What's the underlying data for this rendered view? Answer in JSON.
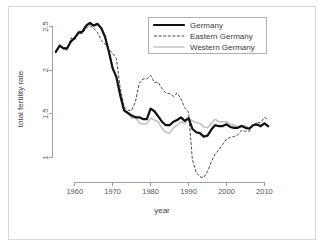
{
  "figure": {
    "background_color": "#ffffff",
    "border_color": "#d8d8d8"
  },
  "chart_data": {
    "type": "line",
    "title": "",
    "xlabel": "year",
    "ylabel": "total fertility rate",
    "xlim": [
      1954,
      2012
    ],
    "ylim": [
      0.72,
      2.62
    ],
    "xticks": [
      1960,
      1970,
      1980,
      1990,
      2000,
      2010
    ],
    "xticklabels": [
      "1960",
      "1970",
      "1980",
      "1990",
      "2000",
      "2010"
    ],
    "yticks": [
      1,
      1.5,
      2,
      2.5
    ],
    "yticklabels": [
      "1",
      "1.5",
      "2",
      "2.5"
    ],
    "grid": false,
    "legend_position": "top-right",
    "series": [
      {
        "name": "Germany",
        "color": "#111111",
        "style": "solid-thick",
        "x": [
          1955,
          1956,
          1957,
          1958,
          1959,
          1960,
          1961,
          1962,
          1963,
          1964,
          1965,
          1966,
          1967,
          1968,
          1969,
          1970,
          1971,
          1972,
          1973,
          1974,
          1975,
          1976,
          1977,
          1978,
          1979,
          1980,
          1981,
          1982,
          1983,
          1984,
          1985,
          1986,
          1987,
          1988,
          1989,
          1990,
          1991,
          1992,
          1993,
          1994,
          1995,
          1996,
          1997,
          1998,
          1999,
          2000,
          2001,
          2002,
          2003,
          2004,
          2005,
          2006,
          2007,
          2008,
          2009,
          2010,
          2011
        ],
        "values": [
          2.21,
          2.28,
          2.25,
          2.25,
          2.33,
          2.37,
          2.43,
          2.44,
          2.51,
          2.54,
          2.51,
          2.53,
          2.48,
          2.38,
          2.21,
          2.02,
          1.92,
          1.71,
          1.54,
          1.51,
          1.48,
          1.46,
          1.46,
          1.44,
          1.44,
          1.56,
          1.53,
          1.47,
          1.41,
          1.37,
          1.37,
          1.41,
          1.43,
          1.46,
          1.42,
          1.45,
          1.33,
          1.29,
          1.28,
          1.24,
          1.25,
          1.32,
          1.37,
          1.36,
          1.36,
          1.38,
          1.35,
          1.34,
          1.34,
          1.36,
          1.34,
          1.33,
          1.37,
          1.38,
          1.36,
          1.39,
          1.36
        ]
      },
      {
        "name": "Eastern Germany",
        "color": "#4a4a4a",
        "style": "dashed",
        "x": [
          1955,
          1956,
          1957,
          1958,
          1959,
          1960,
          1961,
          1962,
          1963,
          1964,
          1965,
          1966,
          1967,
          1968,
          1969,
          1970,
          1971,
          1972,
          1973,
          1974,
          1975,
          1976,
          1977,
          1978,
          1979,
          1980,
          1981,
          1982,
          1983,
          1984,
          1985,
          1986,
          1987,
          1988,
          1989,
          1990,
          1991,
          1992,
          1993,
          1994,
          1995,
          1996,
          1997,
          1998,
          1999,
          2000,
          2001,
          2002,
          2003,
          2004,
          2005,
          2006,
          2007,
          2008,
          2009,
          2010,
          2011
        ],
        "values": [
          2.21,
          2.28,
          2.24,
          2.23,
          2.37,
          2.35,
          2.42,
          2.42,
          2.48,
          2.51,
          2.48,
          2.43,
          2.34,
          2.3,
          2.24,
          2.19,
          2.13,
          1.79,
          1.58,
          1.54,
          1.54,
          1.64,
          1.85,
          1.9,
          1.9,
          1.94,
          1.86,
          1.86,
          1.79,
          1.74,
          1.73,
          1.7,
          1.74,
          1.67,
          1.57,
          1.52,
          0.98,
          0.83,
          0.78,
          0.77,
          0.84,
          0.95,
          1.04,
          1.09,
          1.15,
          1.21,
          1.23,
          1.24,
          1.26,
          1.31,
          1.3,
          1.3,
          1.37,
          1.4,
          1.4,
          1.46,
          1.43
        ]
      },
      {
        "name": "Western Germany",
        "color": "#c2c2c2",
        "style": "solid-light",
        "x": [
          1955,
          1956,
          1957,
          1958,
          1959,
          1960,
          1961,
          1962,
          1963,
          1964,
          1965,
          1966,
          1967,
          1968,
          1969,
          1970,
          1971,
          1972,
          1973,
          1974,
          1975,
          1976,
          1977,
          1978,
          1979,
          1980,
          1981,
          1982,
          1983,
          1984,
          1985,
          1986,
          1987,
          1988,
          1989,
          1990,
          1991,
          1992,
          1993,
          1994,
          1995,
          1996,
          1997,
          1998,
          1999,
          2000,
          2001,
          2002,
          2003,
          2004,
          2005,
          2006,
          2007,
          2008,
          2009,
          2010,
          2011
        ],
        "values": [
          2.21,
          2.29,
          2.26,
          2.26,
          2.32,
          2.37,
          2.45,
          2.44,
          2.51,
          2.54,
          2.5,
          2.53,
          2.48,
          2.38,
          2.21,
          2.02,
          1.92,
          1.71,
          1.54,
          1.51,
          1.45,
          1.46,
          1.4,
          1.38,
          1.39,
          1.45,
          1.43,
          1.41,
          1.33,
          1.29,
          1.28,
          1.34,
          1.37,
          1.41,
          1.39,
          1.45,
          1.42,
          1.4,
          1.39,
          1.35,
          1.34,
          1.39,
          1.44,
          1.41,
          1.41,
          1.41,
          1.38,
          1.37,
          1.35,
          1.37,
          1.36,
          1.34,
          1.37,
          1.37,
          1.35,
          1.39,
          1.35
        ]
      }
    ]
  },
  "legend": {
    "items": [
      {
        "label": "Germany",
        "key": "germany"
      },
      {
        "label": "Eastern Germany",
        "key": "eastern-germany"
      },
      {
        "label": "Western Germany",
        "key": "western-germany"
      }
    ]
  }
}
